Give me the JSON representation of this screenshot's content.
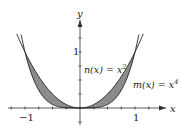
{
  "chart_data": {
    "type": "area",
    "title": "",
    "xlabel": "x",
    "ylabel": "y",
    "x_ticks": [
      -1,
      1
    ],
    "y_ticks": [
      1
    ],
    "xlim": [
      -1.4,
      1.45
    ],
    "ylim": [
      -0.35,
      1.35
    ],
    "series": [
      {
        "name": "n(x) = x^2",
        "function": "x^2",
        "x": [
          -1.15,
          -1,
          -0.75,
          -0.5,
          -0.25,
          0,
          0.25,
          0.5,
          0.75,
          1,
          1.15
        ],
        "y": [
          1.3225,
          1,
          0.5625,
          0.25,
          0.0625,
          0,
          0.0625,
          0.25,
          0.5625,
          1,
          1.3225
        ]
      },
      {
        "name": "m(x) = x^4",
        "function": "x^4",
        "x": [
          -1.07,
          -1,
          -0.75,
          -0.5,
          -0.25,
          0,
          0.25,
          0.5,
          0.75,
          1,
          1.07
        ],
        "y": [
          1.31,
          1,
          0.3164,
          0.0625,
          0.0039,
          0,
          0.0039,
          0.0625,
          0.3164,
          1,
          1.31
        ]
      }
    ],
    "shaded_region": {
      "between": [
        "x^2",
        "x^4"
      ],
      "x_range": [
        -1,
        1
      ],
      "color": "#8a8a8a"
    },
    "annotations": [
      {
        "text": "n(x) = x",
        "sup": "2"
      },
      {
        "text": "m(x) = x",
        "sup": "4"
      }
    ],
    "grid": false,
    "legend": "none"
  },
  "labels": {
    "x_axis": "x",
    "y_axis": "y",
    "tick_neg1": "−1",
    "tick_pos1": "1",
    "tick_y1": "1",
    "n_label": "n(x) = x",
    "n_sup": "2",
    "m_label": "m(x) = x",
    "m_sup": "4"
  }
}
